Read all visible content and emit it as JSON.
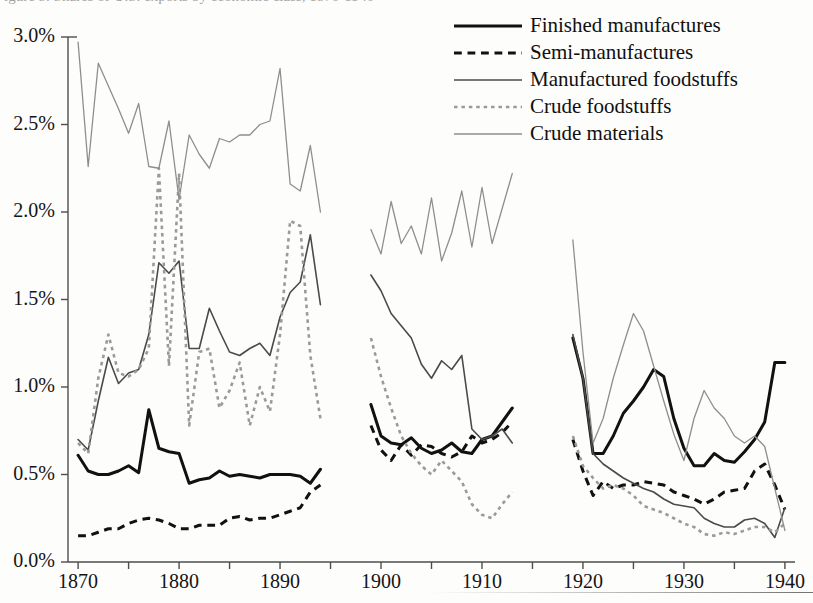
{
  "caption_sliver": "igure 5.  Shares of U.S. exports by economic class, 1870-1940",
  "colors": {
    "finished_manufactures": "#111111",
    "semi_manufactures": "#111111",
    "manufactured_foodstuffs": "#4a4a4a",
    "crude_foodstuffs": "#9a9a9a",
    "crude_materials": "#8e8e8e",
    "axis": "#4d4d4d",
    "background": "#fdfdfc"
  },
  "legend": {
    "position": "top-right",
    "items": [
      {
        "label": "Finished manufactures",
        "style": "solid",
        "width": 3.0,
        "color": "#111111",
        "key": "legend-key-finished-manufactures"
      },
      {
        "label": "Semi-manufactures",
        "style": "dashed",
        "width": 3.0,
        "color": "#111111",
        "key": "legend-key-semi-manufactures"
      },
      {
        "label": "Manufactured foodstuffs",
        "style": "solid",
        "width": 1.6,
        "color": "#4a4a4a",
        "key": "legend-key-manufactured-foodstuffs"
      },
      {
        "label": "Crude foodstuffs",
        "style": "dotted",
        "width": 2.6,
        "color": "#9a9a9a",
        "key": "legend-key-crude-foodstuffs"
      },
      {
        "label": "Crude materials",
        "style": "solid",
        "width": 1.3,
        "color": "#8e8e8e",
        "key": "legend-key-crude-materials"
      }
    ]
  },
  "chart_data": {
    "type": "line",
    "title": "",
    "xlabel": "",
    "ylabel": "",
    "xlim": [
      1869.0,
      1941.0
    ],
    "ylim": [
      0.0,
      3.0
    ],
    "yunit": "%",
    "grid": false,
    "ytick_labels": [
      "0.0%",
      "0.5%",
      "1.0%",
      "1.5%",
      "2.0%",
      "2.5%",
      "3.0%"
    ],
    "ytick_values": [
      0.0,
      0.5,
      1.0,
      1.5,
      2.0,
      2.5,
      3.0
    ],
    "xtick_labels": [
      "1870",
      "1880",
      "1890",
      "1900",
      "1910",
      "1920",
      "1930",
      "1940"
    ],
    "xtick_values": [
      1870,
      1880,
      1890,
      1900,
      1910,
      1920,
      1930,
      1940
    ],
    "xminor_values": [
      1875,
      1885,
      1895,
      1905,
      1915,
      1925,
      1935
    ],
    "segments": [
      {
        "name": "1870-1894",
        "x_start": 1870,
        "x_end": 1894
      },
      {
        "name": "1899-1913",
        "x_start": 1899,
        "x_end": 1913
      },
      {
        "name": "1919-1940",
        "x_start": 1919,
        "x_end": 1940
      }
    ],
    "series": [
      {
        "name": "Finished manufactures",
        "style": "solid",
        "color": "#111111",
        "width": 3.0,
        "segments": [
          {
            "x": [
              1870,
              1871,
              1872,
              1873,
              1874,
              1875,
              1876,
              1877,
              1878,
              1879,
              1880,
              1881,
              1882,
              1883,
              1884,
              1885,
              1886,
              1887,
              1888,
              1889,
              1890,
              1891,
              1892,
              1893,
              1894
            ],
            "y": [
              0.61,
              0.52,
              0.5,
              0.5,
              0.52,
              0.55,
              0.51,
              0.87,
              0.65,
              0.63,
              0.62,
              0.45,
              0.47,
              0.48,
              0.52,
              0.49,
              0.5,
              0.49,
              0.48,
              0.5,
              0.5,
              0.5,
              0.49,
              0.45,
              0.53
            ]
          },
          {
            "x": [
              1899,
              1900,
              1901,
              1902,
              1903,
              1904,
              1905,
              1906,
              1907,
              1908,
              1909,
              1910,
              1911,
              1912,
              1913
            ],
            "y": [
              0.9,
              0.72,
              0.68,
              0.67,
              0.71,
              0.65,
              0.62,
              0.64,
              0.68,
              0.63,
              0.62,
              0.7,
              0.72,
              0.8,
              0.88
            ]
          },
          {
            "x": [
              1919,
              1920,
              1921,
              1922,
              1923,
              1924,
              1925,
              1926,
              1927,
              1928,
              1929,
              1930,
              1931,
              1932,
              1933,
              1934,
              1935,
              1936,
              1937,
              1938,
              1939,
              1940
            ],
            "y": [
              1.28,
              1.05,
              0.62,
              0.62,
              0.72,
              0.85,
              0.92,
              1.0,
              1.1,
              1.06,
              0.82,
              0.65,
              0.55,
              0.55,
              0.62,
              0.58,
              0.57,
              0.63,
              0.7,
              0.8,
              1.14,
              1.14
            ]
          }
        ]
      },
      {
        "name": "Semi-manufactures",
        "style": "dashed",
        "color": "#111111",
        "width": 3.0,
        "segments": [
          {
            "x": [
              1870,
              1871,
              1872,
              1873,
              1874,
              1875,
              1876,
              1877,
              1878,
              1879,
              1880,
              1881,
              1882,
              1883,
              1884,
              1885,
              1886,
              1887,
              1888,
              1889,
              1890,
              1891,
              1892,
              1893,
              1894
            ],
            "y": [
              0.15,
              0.15,
              0.17,
              0.19,
              0.19,
              0.22,
              0.24,
              0.25,
              0.24,
              0.22,
              0.19,
              0.19,
              0.21,
              0.21,
              0.21,
              0.25,
              0.26,
              0.24,
              0.25,
              0.25,
              0.27,
              0.29,
              0.31,
              0.4,
              0.44
            ]
          },
          {
            "x": [
              1899,
              1900,
              1901,
              1902,
              1903,
              1904,
              1905,
              1906,
              1907,
              1908,
              1909,
              1910,
              1911,
              1912,
              1913
            ],
            "y": [
              0.78,
              0.64,
              0.58,
              0.67,
              0.61,
              0.67,
              0.66,
              0.62,
              0.6,
              0.63,
              0.72,
              0.68,
              0.7,
              0.74,
              0.8
            ]
          },
          {
            "x": [
              1919,
              1920,
              1921,
              1922,
              1923,
              1924,
              1925,
              1926,
              1927,
              1928,
              1929,
              1930,
              1931,
              1932,
              1933,
              1934,
              1935,
              1936,
              1937,
              1938,
              1939,
              1940
            ],
            "y": [
              0.7,
              0.52,
              0.38,
              0.46,
              0.42,
              0.44,
              0.44,
              0.46,
              0.45,
              0.44,
              0.4,
              0.38,
              0.36,
              0.33,
              0.36,
              0.4,
              0.41,
              0.42,
              0.52,
              0.56,
              0.44,
              0.3
            ]
          }
        ]
      },
      {
        "name": "Manufactured foodstuffs",
        "style": "solid",
        "color": "#4a4a4a",
        "width": 1.6,
        "segments": [
          {
            "x": [
              1870,
              1871,
              1872,
              1873,
              1874,
              1875,
              1876,
              1877,
              1878,
              1879,
              1880,
              1881,
              1882,
              1883,
              1884,
              1885,
              1886,
              1887,
              1888,
              1889,
              1890,
              1891,
              1892,
              1893,
              1894
            ],
            "y": [
              0.7,
              0.64,
              0.92,
              1.17,
              1.02,
              1.08,
              1.1,
              1.3,
              1.71,
              1.65,
              1.72,
              1.22,
              1.22,
              1.45,
              1.32,
              1.2,
              1.18,
              1.22,
              1.25,
              1.18,
              1.4,
              1.54,
              1.6,
              1.87,
              1.47
            ]
          },
          {
            "x": [
              1899,
              1900,
              1901,
              1902,
              1903,
              1904,
              1905,
              1906,
              1907,
              1908,
              1909,
              1910,
              1911,
              1912,
              1913
            ],
            "y": [
              1.64,
              1.55,
              1.42,
              1.35,
              1.28,
              1.13,
              1.05,
              1.15,
              1.1,
              1.18,
              0.76,
              0.7,
              0.72,
              0.76,
              0.68
            ]
          },
          {
            "x": [
              1919,
              1920,
              1921,
              1922,
              1923,
              1924,
              1925,
              1926,
              1927,
              1928,
              1929,
              1930,
              1931,
              1932,
              1933,
              1934,
              1935,
              1936,
              1937,
              1938,
              1939,
              1940
            ],
            "y": [
              1.3,
              1.05,
              0.62,
              0.56,
              0.52,
              0.48,
              0.45,
              0.42,
              0.4,
              0.36,
              0.33,
              0.32,
              0.31,
              0.25,
              0.22,
              0.2,
              0.2,
              0.24,
              0.25,
              0.22,
              0.14,
              0.31
            ]
          }
        ]
      },
      {
        "name": "Crude foodstuffs",
        "style": "dotted",
        "color": "#9a9a9a",
        "width": 2.6,
        "segments": [
          {
            "x": [
              1870,
              1871,
              1872,
              1873,
              1874,
              1875,
              1876,
              1877,
              1878,
              1879,
              1880,
              1881,
              1882,
              1883,
              1884,
              1885,
              1886,
              1887,
              1888,
              1889,
              1890,
              1891,
              1892,
              1893,
              1894
            ],
            "y": [
              0.68,
              0.62,
              1.05,
              1.3,
              1.08,
              1.06,
              1.1,
              1.22,
              2.25,
              1.12,
              2.22,
              0.78,
              1.2,
              1.22,
              0.88,
              0.98,
              1.14,
              0.78,
              1.0,
              0.86,
              1.3,
              1.95,
              1.92,
              1.18,
              0.82
            ]
          },
          {
            "x": [
              1899,
              1900,
              1901,
              1902,
              1903,
              1904,
              1905,
              1906,
              1907,
              1908,
              1909,
              1910,
              1911,
              1912,
              1913
            ],
            "y": [
              1.28,
              1.06,
              0.88,
              0.72,
              0.62,
              0.55,
              0.5,
              0.58,
              0.52,
              0.46,
              0.33,
              0.27,
              0.25,
              0.33,
              0.4
            ]
          },
          {
            "x": [
              1919,
              1920,
              1921,
              1922,
              1923,
              1924,
              1925,
              1926,
              1927,
              1928,
              1929,
              1930,
              1931,
              1932,
              1933,
              1934,
              1935,
              1936,
              1937,
              1938,
              1939,
              1940
            ],
            "y": [
              0.72,
              0.55,
              0.48,
              0.42,
              0.44,
              0.42,
              0.38,
              0.32,
              0.3,
              0.28,
              0.25,
              0.22,
              0.2,
              0.16,
              0.15,
              0.17,
              0.16,
              0.18,
              0.2,
              0.2,
              0.17,
              0.22
            ]
          }
        ]
      },
      {
        "name": "Crude materials",
        "style": "solid",
        "color": "#8e8e8e",
        "width": 1.3,
        "segments": [
          {
            "x": [
              1870,
              1871,
              1872,
              1873,
              1874,
              1875,
              1876,
              1877,
              1878,
              1879,
              1880,
              1881,
              1882,
              1883,
              1884,
              1885,
              1886,
              1887,
              1888,
              1889,
              1890,
              1891,
              1892,
              1893,
              1894
            ],
            "y": [
              2.97,
              2.26,
              2.85,
              2.72,
              2.59,
              2.45,
              2.62,
              2.26,
              2.25,
              2.52,
              2.07,
              2.44,
              2.33,
              2.25,
              2.42,
              2.4,
              2.44,
              2.44,
              2.5,
              2.52,
              2.82,
              2.16,
              2.12,
              2.38,
              2.0
            ]
          },
          {
            "x": [
              1899,
              1900,
              1901,
              1902,
              1903,
              1904,
              1905,
              1906,
              1907,
              1908,
              1909,
              1910,
              1911,
              1912,
              1913
            ],
            "y": [
              1.9,
              1.76,
              2.06,
              1.82,
              1.92,
              1.76,
              2.08,
              1.72,
              1.88,
              2.12,
              1.8,
              2.14,
              1.82,
              2.02,
              2.22
            ]
          },
          {
            "x": [
              1919,
              1920,
              1921,
              1922,
              1923,
              1924,
              1925,
              1926,
              1927,
              1928,
              1929,
              1930,
              1931,
              1932,
              1933,
              1934,
              1935,
              1936,
              1937,
              1938,
              1939,
              1940
            ],
            "y": [
              1.84,
              1.2,
              0.68,
              0.82,
              1.05,
              1.24,
              1.42,
              1.32,
              1.12,
              0.92,
              0.73,
              0.58,
              0.82,
              0.98,
              0.88,
              0.82,
              0.72,
              0.68,
              0.72,
              0.66,
              0.42,
              0.18
            ]
          }
        ]
      }
    ]
  }
}
